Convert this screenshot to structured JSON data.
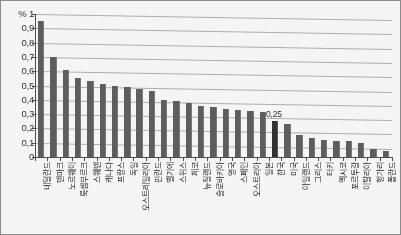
{
  "chart_data": {
    "type": "bar",
    "title": "",
    "subtitle": "",
    "xlabel": "",
    "ylabel": "%",
    "ylim": [
      0,
      1
    ],
    "ytick_labels": [
      "% 1",
      "0,9",
      "0,8",
      "0,7",
      "0,6",
      "0,5",
      "0,4",
      "0,3",
      "0,2",
      "0,1",
      "0"
    ],
    "ytick_values": [
      1,
      0.9,
      0.8,
      0.7,
      0.6,
      0.5,
      0.4,
      0.3,
      0.2,
      0.1,
      0
    ],
    "grid": true,
    "legend": "none",
    "decimal_separator": ",",
    "categories": [
      "네덜란드",
      "덴마크",
      "노르웨이",
      "룩셈부르크",
      "스웨덴",
      "캐나다",
      "프랑스",
      "독일",
      "오스트레일리아",
      "핀란드",
      "벨기에",
      "스위스",
      "체코",
      "뉴질랜드",
      "슬로바키아",
      "영국",
      "스페인",
      "오스트리아",
      "일본",
      "한국",
      "미국",
      "아일랜드",
      "그리스",
      "터키",
      "멕시코",
      "포르투갈",
      "이탈리아",
      "헝가리",
      "폴란드"
    ],
    "values": [
      0.95,
      0.7,
      0.61,
      0.55,
      0.53,
      0.51,
      0.5,
      0.49,
      0.475,
      0.46,
      0.4,
      0.39,
      0.375,
      0.36,
      0.35,
      0.335,
      0.33,
      0.325,
      0.315,
      0.25,
      0.23,
      0.155,
      0.13,
      0.12,
      0.115,
      0.11,
      0.1,
      0.055,
      0.04
    ],
    "highlight_index": 19,
    "highlight_label": "0,25",
    "series_color": "#5c5c5c",
    "highlight_color": "#2b2b2b",
    "grid_color": "#b0b0b0",
    "axis_color": "#4a4a4a"
  }
}
